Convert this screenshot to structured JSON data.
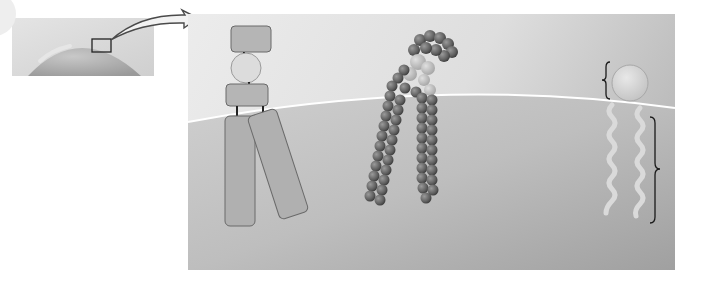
{
  "figure": {
    "title": "",
    "panels": [
      {
        "id": "inset",
        "description": "Cell surface (membrane bilayer dome) with magnified region box"
      },
      {
        "id": "schematic",
        "description": "Schematic phospholipid: head group, glycerol, fatty acid tails"
      },
      {
        "id": "space-filling",
        "description": "Space-filling molecular model of phospholipid"
      },
      {
        "id": "symbol",
        "description": "Phospholipid symbol: hydrophilic head, hydrophobic tails with braces"
      }
    ],
    "labels": []
  },
  "colors": {
    "background": "#ffffff",
    "panel_light": "#e6e6e6",
    "panel_dark": "#a8a8a8",
    "interior_top": "#c9c9c9",
    "interior_bottom": "#a3a3a3",
    "box_fill": "#b3b3b3",
    "box_stroke": "#6e6e6e",
    "head_fill": "#dcdcdc",
    "atom_dark": "#6a6a6a",
    "atom_light": "#c4c4c4",
    "tail_color": "#d9d9d9",
    "brace_color": "#1a1a1a"
  }
}
